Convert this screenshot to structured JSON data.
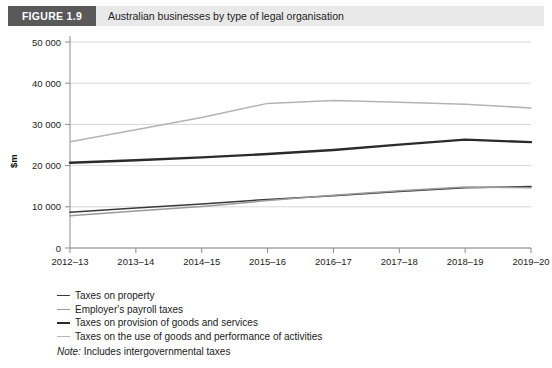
{
  "header": {
    "badge": "FIGURE 1.9",
    "title": "Australian businesses by type of legal organisation",
    "badge_bg": "#595959",
    "bar_bg": "#e9e9e9"
  },
  "legend": {
    "items": [
      {
        "label": "Taxes on property",
        "color": "#3a3a3a",
        "style": "thin"
      },
      {
        "label": "Employer's payroll taxes",
        "color": "#9a9a9a",
        "style": "light"
      },
      {
        "label": "Taxes on provision of goods and services",
        "color": "#2b2b2b",
        "style": "thick"
      },
      {
        "label": "Taxes on the use of goods and performance of activities",
        "color": "#b4b4b4",
        "style": "pale"
      }
    ],
    "note_prefix": "Note:",
    "note_text": "Includes intergovernmental taxes"
  },
  "chart_data": {
    "type": "line",
    "title": "Australian businesses by type of legal organisation",
    "xlabel": "",
    "ylabel": "$m",
    "ylim": [
      0,
      50000
    ],
    "yticks": [
      0,
      10000,
      20000,
      30000,
      40000,
      50000
    ],
    "ytick_labels": [
      "0",
      "10 000",
      "20 000",
      "30 000",
      "40 000",
      "50 000"
    ],
    "grid": true,
    "grid_axis": "y",
    "legend_position": "below",
    "categories": [
      "2012–13",
      "2013–14",
      "2014–15",
      "2015–16",
      "2016–17",
      "2017–18",
      "2018–19",
      "2019–20"
    ],
    "series": [
      {
        "name": "Taxes on the use of goods and performance of activities",
        "color": "#b4b4b4",
        "width": 1.5,
        "values": [
          25800,
          28700,
          31700,
          35100,
          35800,
          35400,
          34900,
          34000
        ]
      },
      {
        "name": "Taxes on provision of goods and services",
        "color": "#2b2b2b",
        "width": 2.4,
        "values": [
          20700,
          21300,
          22000,
          22800,
          23800,
          25100,
          26300,
          25700
        ]
      },
      {
        "name": "Taxes on property",
        "color": "#3a3a3a",
        "width": 1.5,
        "values": [
          8700,
          9700,
          10700,
          11800,
          12700,
          13700,
          14600,
          14900
        ]
      },
      {
        "name": "Employer's payroll taxes",
        "color": "#9a9a9a",
        "width": 1.5,
        "values": [
          7800,
          9000,
          10100,
          11500,
          12800,
          13900,
          14800,
          14600
        ]
      }
    ],
    "axis_color": "#8c8c8c",
    "grid_color": "#d8d8d8",
    "tick_label_color": "#222222"
  }
}
